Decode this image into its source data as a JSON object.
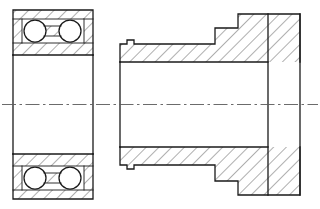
{
  "drawing": {
    "title": "Double-row ball bearing and stepped hub cross-section",
    "view_type": "sectional-assembly-drawing",
    "canvas": {
      "width": 320,
      "height": 209,
      "background": "#ffffff"
    },
    "style": {
      "line_color": "#1a1a1a",
      "hatch_color": "#2a2a2a",
      "centerline_color": "#5a5a5a",
      "fill_color": "#ffffff"
    },
    "centerline": {
      "label": "axis-of-rotation",
      "y": 104.5,
      "x_start": 2,
      "x_end": 318,
      "pattern": "dash-dot"
    },
    "components": [
      {
        "id": "bearing",
        "label": "double-row ball bearing",
        "x_left": 13,
        "x_right": 93,
        "outer_top": 10,
        "outer_bottom": 199,
        "ring_thickness": 9,
        "ball_count_per_section": 2,
        "ball_radius": 11,
        "balls_top": [
          {
            "cx": 35,
            "cy": 31,
            "r": 11
          },
          {
            "cx": 70,
            "cy": 31,
            "r": 11
          }
        ],
        "balls_bottom": [
          {
            "cx": 35,
            "cy": 178,
            "r": 11
          },
          {
            "cx": 70,
            "cy": 178,
            "r": 11
          }
        ],
        "bore_top_y": 55,
        "bore_bottom_y": 154,
        "hatch_angle_deg": 45
      },
      {
        "id": "hub",
        "label": "stepped hub sleeve",
        "x_left": 120,
        "x_right": 300,
        "outer_top": 10,
        "outer_bottom": 199,
        "bore_top_y": 62,
        "bore_bottom_y": 147,
        "relief_groove": {
          "label": "relief-groove",
          "x": 127,
          "width": 7,
          "depth": 4
        },
        "steps_top": [
          {
            "x_start": 120,
            "x_end": 215,
            "y": 44
          },
          {
            "x_start": 215,
            "x_end": 238,
            "y": 28
          },
          {
            "x_start": 238,
            "x_end": 268,
            "y": 14
          },
          {
            "x_start": 268,
            "x_end": 300,
            "y": 14
          }
        ],
        "steps_bottom": [
          {
            "x_start": 120,
            "x_end": 215,
            "y": 165
          },
          {
            "x_start": 215,
            "x_end": 238,
            "y": 181
          },
          {
            "x_start": 238,
            "x_end": 268,
            "y": 195
          },
          {
            "x_start": 268,
            "x_end": 300,
            "y": 195
          }
        ],
        "flange": {
          "label": "end-flange",
          "x_start": 268,
          "x_end": 300,
          "top": 14,
          "bottom": 195
        },
        "hatch_angle_deg": 45
      }
    ]
  }
}
